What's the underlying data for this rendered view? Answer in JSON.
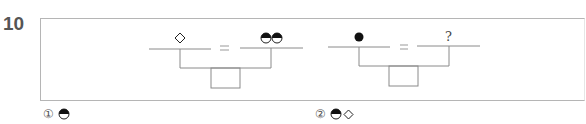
{
  "question": {
    "number": "10"
  },
  "diagram": {
    "left_equation": {
      "left_symbol": "white-diamond",
      "operator": "=",
      "right_symbol": "two-half-black-circles"
    },
    "right_equation": {
      "left_symbol": "black-circle",
      "operator": "=",
      "right_symbol": "?"
    },
    "question_mark": "?",
    "equals": "="
  },
  "choices": [
    {
      "number": "①",
      "symbols": [
        "half-black-circle"
      ]
    },
    {
      "number": "②",
      "symbols": [
        "half-black-circle",
        "white-diamond"
      ]
    }
  ],
  "colors": {
    "line": "#8a8a8a",
    "symbol": "#111111",
    "box_border": "#b5b5b5"
  }
}
